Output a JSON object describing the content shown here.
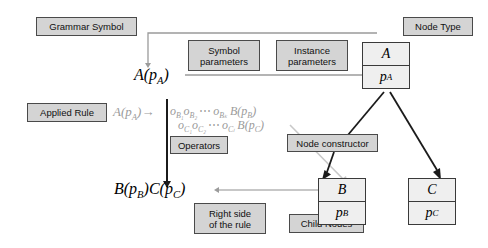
{
  "diagram": {
    "labels": {
      "grammar_symbol": "Grammar Symbol",
      "node_type": "Node Type",
      "symbol_parameters": "Symbol\nparameters",
      "instance_parameters": "Instance\nparameters",
      "applied_rule": "Applied Rule",
      "operators": "Operators",
      "node_constructor": "Node constructor",
      "right_side": "Right side\nof the rule",
      "child_nodes": "Child Nodes"
    },
    "math": {
      "symbol_A": {
        "head": "A",
        "open": "(",
        "param": "p",
        "param_sub": "A",
        "close": ")"
      },
      "rule_lhs": {
        "head": "A",
        "open": "(",
        "param": "p",
        "param_sub": "A",
        "close": ")"
      },
      "rule_arrow": "→",
      "rule_line1": {
        "op1": "o",
        "op1_sub": "B₁",
        "op2": "o",
        "op2_sub": "B₂",
        "ellipsis": "⋯",
        "opk": "o",
        "opk_sub": "Bₖ",
        "result": "B",
        "open": "(",
        "param": "p",
        "param_sub": "B",
        "close": ")"
      },
      "rule_line2": {
        "op1": "o",
        "op1_sub": "C₁",
        "op2": "o",
        "op2_sub": "C₂",
        "ellipsis": "⋯",
        "opl": "o",
        "opl_sub": "Cₗ",
        "result": "B",
        "open": "(",
        "param": "p",
        "param_sub": "C",
        "close": ")"
      },
      "right_side_expr": {
        "b": "B",
        "b_open": "(",
        "b_param": "p",
        "b_param_sub": "B",
        "b_close": ")",
        "c": "C",
        "c_open": "(",
        "c_param": "p",
        "c_param_sub": "C",
        "c_close": ")"
      }
    },
    "nodes": [
      {
        "id": "node-a",
        "type": "A",
        "param": "p",
        "param_sub": "A"
      },
      {
        "id": "node-b",
        "type": "B",
        "param": "p",
        "param_sub": "B"
      },
      {
        "id": "node-c",
        "type": "C",
        "param": "p",
        "param_sub": "C"
      }
    ],
    "colors": {
      "label_fill": "#d4d4d4",
      "label_border": "#4a4a4a",
      "node_fill": "#efefef",
      "node_border": "#3a3a3a",
      "grey_ink": "#9b9b9b",
      "dark_ink": "#1b1b1b",
      "background": "#ffffff"
    }
  }
}
